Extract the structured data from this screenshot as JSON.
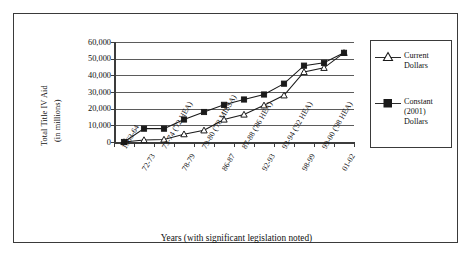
{
  "chart_data": {
    "type": "line",
    "title": "",
    "xlabel": "Years (with significant legislation noted)",
    "ylabel": "Total Title IV Aid (in millions)",
    "ylabel_line1": "Total Title IV Aid",
    "ylabel_line2": "(in millions)",
    "ylim": [
      0,
      60000
    ],
    "ytick_labels": [
      "60,000",
      "50,000",
      "40,000",
      "30,000",
      "20,000",
      "10,000",
      "0"
    ],
    "ytick_values": [
      60000,
      50000,
      40000,
      30000,
      20000,
      10000,
      0
    ],
    "grid": true,
    "legend_position": "right-outside",
    "categories": [
      "1963-64",
      "72-73",
      "73-74 ('72 HEA)",
      "78-79",
      "79-80 ('78 MISSA)",
      "86-87",
      "87-88 ('86 HEA)",
      "92-93",
      "93-94 ('92 HEA)",
      "98-99",
      "99-00 ('98 HEA)",
      "01-02"
    ],
    "series": [
      {
        "name": "Current Dollars",
        "marker": "open-triangle",
        "color": "#1a1a1a",
        "values": [
          0,
          1200,
          1500,
          4700,
          7000,
          13500,
          16500,
          22000,
          28000,
          42000,
          44500,
          53500
        ]
      },
      {
        "name": "Constant (2001) Dollars",
        "marker": "filled-square",
        "color": "#1a1a1a",
        "values": [
          0,
          8000,
          8000,
          13500,
          18000,
          22300,
          25500,
          28500,
          35000,
          45800,
          47500,
          53500
        ]
      }
    ]
  },
  "legend": {
    "items": [
      {
        "label_line1": "Current",
        "label_line2": "Dollars",
        "label_line3": ""
      },
      {
        "label_line1": "Constant",
        "label_line2": "(2001)",
        "label_line3": "Dollars"
      }
    ]
  }
}
